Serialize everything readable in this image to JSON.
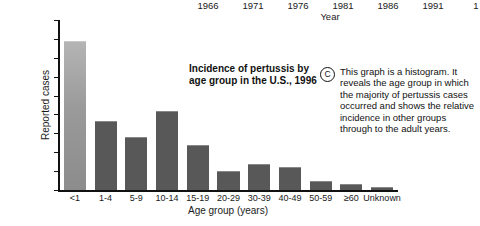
{
  "top_year_axis": {
    "axis_title": "Year",
    "ticks": [
      {
        "label": "1966",
        "x": 208
      },
      {
        "label": "1971",
        "x": 253
      },
      {
        "label": "1976",
        "x": 298
      },
      {
        "label": "1981",
        "x": 343
      },
      {
        "label": "1986",
        "x": 388
      },
      {
        "label": "1991",
        "x": 433
      },
      {
        "label": "1",
        "x": 476
      }
    ]
  },
  "callout": {
    "badge": "C",
    "text": "This graph is a histogram. It reveals the age group in which the majority of pertussis cases occurred and shows the relative incidence in other groups through to the adult years."
  },
  "colors": {
    "bar": "#585858",
    "bar_highlight": "#9a9a9a",
    "axis": "#111111",
    "background": "#ffffff"
  },
  "chart_data": {
    "type": "bar",
    "title": "Incidence of pertussis by\nage group in the U.S., 1996",
    "xlabel": "Age group (years)",
    "ylabel": "Reported cases",
    "categories": [
      "<1",
      "1-4",
      "5-9",
      "10-14",
      "15-19",
      "20-29",
      "30-39",
      "40-49",
      "50-59",
      "≥60",
      "Unknown"
    ],
    "values": [
      2350,
      1080,
      830,
      1240,
      705,
      285,
      400,
      350,
      120,
      85,
      25
    ],
    "ylim": [
      0,
      2700
    ],
    "yticks": [
      0,
      300,
      600,
      900,
      1200,
      1500,
      1800,
      2100,
      2400,
      2700
    ],
    "ytick_labels": [
      "0",
      "300",
      "600",
      "900",
      "1,200",
      "1,500",
      "1,800",
      "2,100",
      "2,400",
      "2,700"
    ],
    "grid": false,
    "legend": "none"
  }
}
